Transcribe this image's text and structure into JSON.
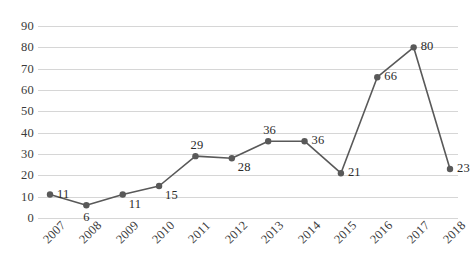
{
  "chart_data": {
    "type": "line",
    "title": "",
    "subtitle": "",
    "xlabel": "",
    "ylabel": "",
    "categories": [
      "2007",
      "2008",
      "2009",
      "2010",
      "2011",
      "2012",
      "2013",
      "2014",
      "2015",
      "2016",
      "2017",
      "2018"
    ],
    "values": [
      11,
      6,
      11,
      15,
      29,
      28,
      36,
      36,
      21,
      66,
      80,
      23
    ],
    "series": [
      {
        "name": "",
        "values": [
          11,
          6,
          11,
          15,
          29,
          28,
          36,
          36,
          21,
          66,
          80,
          23
        ]
      }
    ],
    "data_labels": [
      "11",
      "6",
      "11",
      "15",
      "29",
      "28",
      "36",
      "36",
      "21",
      "66",
      "80",
      "23"
    ],
    "data_label_positions": [
      "right",
      "below",
      "below-right",
      "below-right",
      "above",
      "below-right",
      "above",
      "right",
      "right",
      "right",
      "right",
      "right"
    ],
    "ylim": [
      0,
      90
    ],
    "ytick_step": 10,
    "yticks": [
      90,
      80,
      70,
      60,
      50,
      40,
      30,
      20,
      10,
      0
    ],
    "ytick_labels": [
      "90",
      "80",
      "70",
      "60",
      "50",
      "40",
      "30",
      "20",
      "10",
      "0"
    ],
    "xtick_labels": [
      "2007",
      "2008",
      "2009",
      "2010",
      "2011",
      "2012",
      "2013",
      "2014",
      "2015",
      "2016",
      "2017",
      "2018"
    ],
    "xtick_rotation_degrees": -45,
    "grid": {
      "horizontal": true,
      "vertical": false,
      "color": "#d6d6d6"
    },
    "legend": {
      "visible": false,
      "position": "none",
      "entries": []
    },
    "style": {
      "line_color": "#595959",
      "marker_color": "#595959",
      "marker_shape": "circle",
      "marker_radius": 3.2,
      "line_width": 1.6,
      "background": "#ffffff",
      "text_color": "#2b2b2b"
    }
  }
}
